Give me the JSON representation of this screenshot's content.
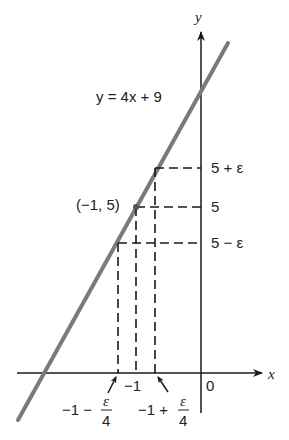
{
  "diagram": {
    "type": "epsilon-delta-linear-function",
    "axes": {
      "x_label": "x",
      "y_label": "y",
      "origin_label": "0"
    },
    "line": {
      "equation_label": "y = 4x + 9",
      "color": "#7a7a7a"
    },
    "point": {
      "label": "(−1, 5)",
      "x": -1,
      "y": 5
    },
    "y_ticks": [
      {
        "label": "5 + ε",
        "value": "5+epsilon"
      },
      {
        "label": "5",
        "value": "5"
      },
      {
        "label": "5 − ε",
        "value": "5-epsilon"
      }
    ],
    "x_ticks": [
      {
        "label": "−1",
        "value": "-1"
      }
    ],
    "x_fraction_labels": [
      {
        "prefix": "−1 −",
        "numerator": "ε",
        "denominator": "4"
      },
      {
        "prefix": "−1 +",
        "numerator": "ε",
        "denominator": "4"
      }
    ],
    "colors": {
      "axis": "#1a1a1a",
      "dashed": "#1a1a1a",
      "text": "#222222"
    }
  }
}
